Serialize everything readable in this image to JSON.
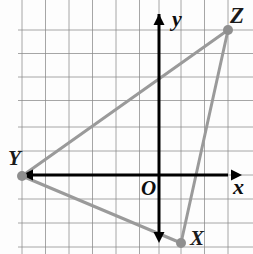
{
  "figure": {
    "kind": "coordinate-plane-triangle",
    "width": 253,
    "height": 254,
    "background_color": "#fdfdfd"
  },
  "grid": {
    "visible": true,
    "color": "#8a8a8a",
    "line_width": 1,
    "cell_size_px": 23.5,
    "vertical_lines_px": [
      22,
      45.5,
      69,
      92.5,
      116,
      139.5,
      159,
      181,
      204.5,
      228
    ],
    "horizontal_lines_px": [
      30,
      53.5,
      77,
      100.5,
      127,
      151,
      175,
      199,
      223,
      247
    ]
  },
  "axes": {
    "color": "#000000",
    "line_width": 3,
    "origin_px": {
      "x": 159,
      "y": 175
    },
    "x_axis": {
      "label": "x",
      "label_px": {
        "x": 233,
        "y": 176
      },
      "from_px": {
        "x": 20,
        "y": 175
      },
      "to_px": {
        "x": 228,
        "y": 175
      },
      "arrow_start": true,
      "arrow_end": true
    },
    "y_axis": {
      "label": "y",
      "label_px": {
        "x": 172,
        "y": 8
      },
      "from_px": {
        "x": 159,
        "y": 238
      },
      "to_px": {
        "x": 159,
        "y": 14
      },
      "arrow_start": true,
      "arrow_end": true
    },
    "origin_label": "O",
    "origin_label_px": {
      "x": 141,
      "y": 178
    }
  },
  "triangle": {
    "name": "XYZ",
    "stroke_color": "#9a9a9a",
    "stroke_width": 3,
    "vertex_marker_color": "#8f8f8f",
    "vertex_marker_radius_px": 5,
    "vertices": [
      {
        "id": "X",
        "label": "X",
        "pixel": {
          "x": 181,
          "y": 243
        },
        "grid": {
          "x": 1,
          "y": -3
        },
        "label_px": {
          "x": 190,
          "y": 228
        }
      },
      {
        "id": "Y",
        "label": "Y",
        "pixel": {
          "x": 22,
          "y": 176
        },
        "grid": {
          "x": -6,
          "y": 0
        },
        "label_px": {
          "x": 8,
          "y": 148
        }
      },
      {
        "id": "Z",
        "label": "Z",
        "pixel": {
          "x": 228,
          "y": 30
        },
        "grid": {
          "x": 3,
          "y": 6
        },
        "label_px": {
          "x": 230,
          "y": 4
        }
      }
    ],
    "edges": [
      {
        "id": "edge-YZ",
        "from": "Y",
        "to": "Z"
      },
      {
        "id": "edge-ZX",
        "from": "Z",
        "to": "X"
      },
      {
        "id": "edge-XY",
        "from": "X",
        "to": "Y"
      }
    ]
  }
}
